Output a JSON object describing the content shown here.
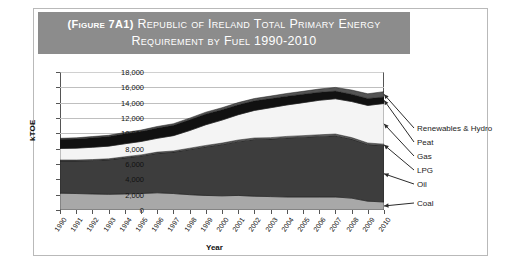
{
  "figure": {
    "title_line1": "(Figure 7A1) Republic of Ireland Total Primary Energy",
    "title_line1_prefix": "(Figure 7A1)",
    "title_line1_rest": "Republic of Ireland Total Primary Energy",
    "title_line2": "Requirement by Fuel 1990-2010",
    "banner_color": "#8c8c8c"
  },
  "chart_data": {
    "type": "area",
    "title": "(Figure 7A1) Republic of Ireland Total Primary Energy Requirement by Fuel 1990-2010",
    "xlabel": "Year",
    "ylabel": "kTOE",
    "stacked": true,
    "grid": true,
    "legend_position": "right-callout",
    "ylim": [
      0,
      18000
    ],
    "yticks": [
      "0",
      "2,000",
      "4,000",
      "6,000",
      "8,000",
      "10,000",
      "12,000",
      "14,000",
      "16,000",
      "18,000"
    ],
    "ytick_values": [
      0,
      2000,
      4000,
      6000,
      8000,
      10000,
      12000,
      14000,
      16000,
      18000
    ],
    "categories": [
      "1990",
      "1991",
      "1992",
      "1993",
      "1994",
      "1995",
      "1996",
      "1997",
      "1998",
      "1999",
      "2000",
      "2001",
      "2002",
      "2003",
      "2004",
      "2005",
      "2006",
      "2007",
      "2008",
      "2009",
      "2010"
    ],
    "series": [
      {
        "name": "Coal",
        "color": "#a8a8a8",
        "values": [
          2200,
          2150,
          2100,
          2050,
          2100,
          2150,
          2250,
          2150,
          2000,
          1900,
          1850,
          1900,
          1800,
          1750,
          1700,
          1700,
          1700,
          1700,
          1550,
          1150,
          1050
        ]
      },
      {
        "name": "Oil",
        "color": "#3d3d3d",
        "values": [
          4200,
          4250,
          4350,
          4500,
          4700,
          4900,
          5150,
          5400,
          5900,
          6350,
          6700,
          7050,
          7400,
          7500,
          7700,
          7800,
          7900,
          8000,
          7700,
          7400,
          7350
        ]
      },
      {
        "name": "LPG",
        "color": "#6e6e6e",
        "values": [
          120,
          120,
          130,
          130,
          140,
          140,
          150,
          150,
          160,
          170,
          180,
          180,
          190,
          190,
          200,
          200,
          210,
          210,
          200,
          190,
          190
        ]
      },
      {
        "name": "Gas",
        "color": "#f4f4f4",
        "values": [
          1500,
          1550,
          1600,
          1650,
          1700,
          1750,
          1800,
          2000,
          2300,
          2700,
          3000,
          3300,
          3600,
          3900,
          4100,
          4300,
          4500,
          4600,
          4700,
          4900,
          5300
        ]
      },
      {
        "name": "Peat",
        "color": "#111111",
        "values": [
          1200,
          1200,
          1250,
          1250,
          1300,
          1300,
          1350,
          1350,
          1400,
          1400,
          1350,
          1300,
          1250,
          1200,
          1150,
          1100,
          1050,
          1000,
          950,
          900,
          850
        ]
      },
      {
        "name": "Renewables & Hydro",
        "color": "#545454",
        "values": [
          130,
          140,
          150,
          160,
          170,
          180,
          190,
          200,
          220,
          240,
          260,
          280,
          300,
          320,
          350,
          380,
          420,
          480,
          550,
          620,
          700
        ]
      }
    ],
    "totals": [
      9350,
      9410,
      9580,
      9740,
      10110,
      10420,
      10890,
      11250,
      11980,
      12760,
      13340,
      14010,
      14540,
      14860,
      15200,
      15480,
      15780,
      15990,
      15650,
      15160,
      15440
    ]
  },
  "legend": {
    "items": [
      {
        "label": "Renewables & Hydro"
      },
      {
        "label": "Peat"
      },
      {
        "label": "Gas"
      },
      {
        "label": "LPG"
      },
      {
        "label": "Oil"
      },
      {
        "label": "Coal"
      }
    ]
  }
}
